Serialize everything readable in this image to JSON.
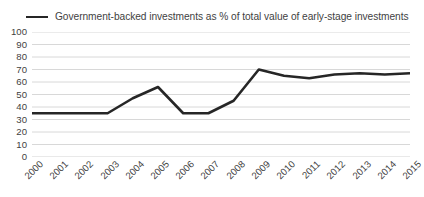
{
  "chart_data": {
    "type": "line",
    "title": "",
    "xlabel": "",
    "ylabel": "",
    "legend_position": "top-left",
    "grid": true,
    "ylim": [
      0,
      100
    ],
    "yticks": [
      100,
      90,
      80,
      70,
      60,
      50,
      40,
      30,
      20,
      10,
      0
    ],
    "categories": [
      "2000",
      "2001",
      "2002",
      "2003",
      "2004",
      "2005",
      "2006",
      "2007",
      "2008",
      "2009",
      "2010",
      "2011",
      "2012",
      "2013",
      "2014",
      "2015"
    ],
    "series": [
      {
        "name": "Government-backed investments as % of total value of early-stage investments",
        "color": "#262626",
        "values": [
          35,
          35,
          35,
          35,
          47,
          56,
          35,
          35,
          45,
          70,
          65,
          63,
          66,
          67,
          66,
          67
        ]
      }
    ]
  },
  "legend": {
    "items": [
      {
        "label": "Government-backed investments as % of total value of early-stage investments",
        "color": "#262626"
      }
    ]
  },
  "colors": {
    "line": "#262626",
    "grid": "#d4d4d4",
    "text": "#3f3f3f",
    "background": "#ffffff"
  }
}
